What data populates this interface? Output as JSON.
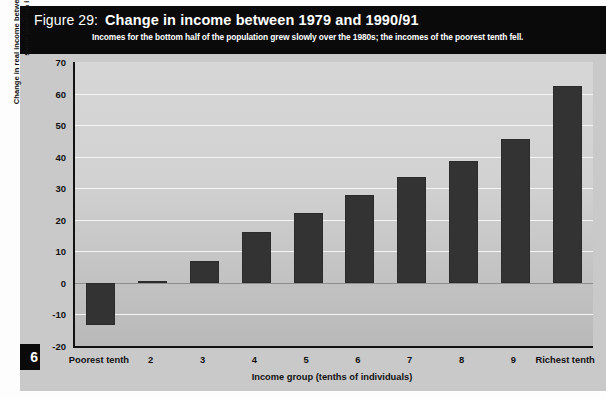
{
  "header": {
    "figure_number": "Figure 29:",
    "title": "Change in income between 1979 and 1990/91",
    "subtitle": "Incomes for the bottom half of the population grew slowly over the 1980s; the incomes of the poorest tenth fell."
  },
  "page_marker": "6",
  "colors": {
    "header_background": "#0a0a0a",
    "plot_background": "#cccccc",
    "bar_fill": "#333333",
    "gridline": "#f4f4f4",
    "axis": "#111111"
  },
  "chart_data": {
    "type": "bar",
    "title": "Change in income between 1979 and 1990/91",
    "subtitle": "Incomes for the bottom half of the population grew slowly over the 1980s; the incomes of the poorest tenth fell.",
    "xlabel": "Income group (tenths of individuals)",
    "ylabel": "Change in real income between 1979 and 1990/91 groups in same position in distribution (%)",
    "categories": [
      "Poorest tenth",
      "2",
      "3",
      "4",
      "5",
      "6",
      "7",
      "8",
      "9",
      "Richest tenth"
    ],
    "values": [
      -13.5,
      0.5,
      7,
      16,
      22,
      28,
      33.5,
      38.5,
      45.5,
      62.5
    ],
    "ylim": [
      -20,
      70
    ],
    "ytick_values": [
      70,
      60,
      50,
      40,
      30,
      20,
      10,
      0,
      -10,
      -20
    ],
    "ytick_labels": [
      "70",
      "60",
      "50",
      "40",
      "30",
      "20",
      "10",
      "0",
      "-10",
      "-20"
    ],
    "grid": true,
    "legend": false
  }
}
